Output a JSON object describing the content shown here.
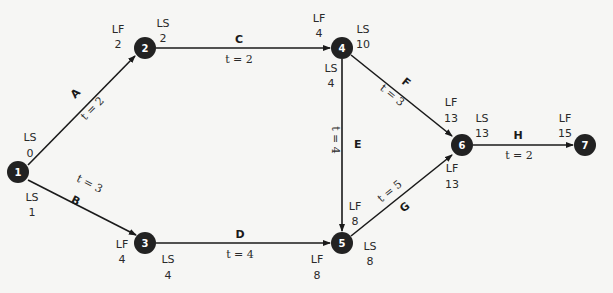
{
  "diagram": {
    "type": "network-diagram",
    "colors": {
      "node_fill": "#222222",
      "node_text": "#ffffff",
      "edge": "#1a1a1a",
      "label": "#2a2a2a",
      "background": "#f6f6f4"
    },
    "nodes": [
      {
        "id": "1",
        "x": 18,
        "y": 172
      },
      {
        "id": "2",
        "x": 145,
        "y": 48
      },
      {
        "id": "3",
        "x": 145,
        "y": 243
      },
      {
        "id": "4",
        "x": 342,
        "y": 48
      },
      {
        "id": "5",
        "x": 342,
        "y": 243
      },
      {
        "id": "6",
        "x": 462,
        "y": 145
      },
      {
        "id": "7",
        "x": 585,
        "y": 145
      }
    ],
    "activities": [
      {
        "name": "A",
        "from": "1",
        "to": "2",
        "duration": "t = 2"
      },
      {
        "name": "B",
        "from": "1",
        "to": "3",
        "duration": "t = 3"
      },
      {
        "name": "C",
        "from": "2",
        "to": "4",
        "duration": "t = 2"
      },
      {
        "name": "D",
        "from": "3",
        "to": "5",
        "duration": "t = 4"
      },
      {
        "name": "E",
        "from": "4",
        "to": "5",
        "duration": "t = 4"
      },
      {
        "name": "F",
        "from": "4",
        "to": "6",
        "duration": "t = 3"
      },
      {
        "name": "G",
        "from": "5",
        "to": "6",
        "duration": "t = 5"
      },
      {
        "name": "H",
        "from": "6",
        "to": "7",
        "duration": "t = 2"
      }
    ],
    "annotations": {
      "n1_ls_a": {
        "label": "LS",
        "value": "0"
      },
      "n1_ls_b": {
        "label": "LS",
        "value": "1"
      },
      "n2_lf": {
        "label": "LF",
        "value": "2"
      },
      "n2_ls": {
        "label": "LS",
        "value": "2"
      },
      "n3_lf": {
        "label": "LF",
        "value": "4"
      },
      "n3_ls": {
        "label": "LS",
        "value": "4"
      },
      "n4_lf": {
        "label": "LF",
        "value": "4"
      },
      "n4_ls_f": {
        "label": "LS",
        "value": "10"
      },
      "n4_ls_e": {
        "label": "LS",
        "value": "4"
      },
      "n5_lf_e": {
        "label": "LF",
        "value": "8"
      },
      "n5_lf_d": {
        "label": "LF",
        "value": "8"
      },
      "n5_ls": {
        "label": "LS",
        "value": "8"
      },
      "n6_lf_f": {
        "label": "LF",
        "value": "13"
      },
      "n6_lf_g": {
        "label": "LF",
        "value": "13"
      },
      "n6_ls": {
        "label": "LS",
        "value": "13"
      },
      "n7_lf": {
        "label": "LF",
        "value": "15"
      }
    }
  }
}
